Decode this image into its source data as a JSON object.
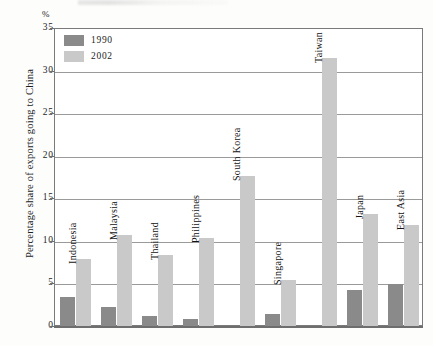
{
  "chart_data": {
    "type": "bar",
    "title": "",
    "subtitle": "",
    "xlabel": "",
    "ylabel": "Percentage share of exports going to China",
    "unit_label": "%",
    "ylim": [
      0,
      35
    ],
    "ytick_labels": [
      "35",
      "30",
      "25",
      "20",
      "15",
      "10",
      "5",
      "0"
    ],
    "ytick_values": [
      35,
      30,
      25,
      20,
      15,
      10,
      5,
      0
    ],
    "grid": true,
    "grid_axis": "y",
    "legend_position": "top-left",
    "categories": [
      "Indonesia",
      "Malaysia",
      "Thailand",
      "Philippines",
      "South Korea",
      "Singapore",
      "Taiwan",
      "Japan",
      "East Asia"
    ],
    "series": [
      {
        "name": "1990",
        "color": "#8a8a8a",
        "values": [
          3.4,
          2.2,
          1.2,
          0.8,
          0.0,
          1.4,
          0.0,
          4.2,
          4.9
        ]
      },
      {
        "name": "2002",
        "color": "#c9c9c9",
        "values": [
          7.9,
          10.7,
          8.3,
          10.3,
          17.6,
          5.4,
          31.5,
          13.1,
          11.9
        ]
      }
    ]
  },
  "legend": {
    "items": [
      {
        "label": "1990",
        "color": "#8a8a8a"
      },
      {
        "label": "2002",
        "color": "#c9c9c9"
      }
    ]
  },
  "axes": {
    "unit": "%",
    "y_title": "Percentage share of exports going to China"
  },
  "colors": {
    "series_1990": "#8a8a8a",
    "series_2002": "#c9c9c9",
    "gridline": "#9a9a9a",
    "frame": "#7a7a7a",
    "text": "#1c1c1c",
    "background": "#ffffff"
  }
}
